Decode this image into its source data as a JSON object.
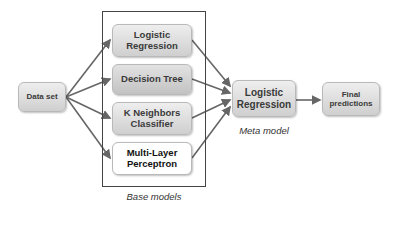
{
  "input": {
    "label": "Data set"
  },
  "base_models": {
    "caption": "Base models",
    "items": [
      {
        "label": "Logistic Regression",
        "line1": "Logistic",
        "line2": "Regression"
      },
      {
        "label": "Decision Tree",
        "line1": "Decision Tree",
        "line2": ""
      },
      {
        "label": "K Neighbors Classifier",
        "line1": "K Neighbors",
        "line2": "Classifier"
      },
      {
        "label": "Multi-Layer Perceptron",
        "line1": "Multi-Layer",
        "line2": "Perceptron"
      }
    ]
  },
  "meta_model": {
    "caption": "Meta model",
    "line1": "Logistic",
    "line2": "Regression"
  },
  "output": {
    "line1": "Final",
    "line2": "predictions"
  },
  "colors": {
    "arrow": "#666666",
    "frame": "#444444",
    "box_fill_top": "#eeeeee",
    "box_fill_bottom": "#cfcfcf"
  }
}
